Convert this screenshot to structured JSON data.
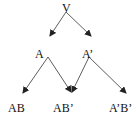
{
  "diagram": {
    "nodes": [
      {
        "id": "V",
        "label": "V"
      },
      {
        "id": "A",
        "label": "A"
      },
      {
        "id": "A_prime",
        "label": "A’"
      },
      {
        "id": "AB",
        "label": "AB"
      },
      {
        "id": "AB_prime",
        "label": "AB’"
      },
      {
        "id": "A_prime_B_prime",
        "label": "A’B’"
      }
    ],
    "edges": [
      {
        "from": "V",
        "to": "A"
      },
      {
        "from": "V",
        "to": "A_prime"
      },
      {
        "from": "A",
        "to": "AB"
      },
      {
        "from": "A",
        "to": "AB_prime"
      },
      {
        "from": "A_prime",
        "to": "AB_prime"
      },
      {
        "from": "A_prime",
        "to": "A_prime_B_prime"
      }
    ],
    "colors": {
      "line": "#333333",
      "text": "#111111",
      "background": "#ffffff"
    }
  }
}
